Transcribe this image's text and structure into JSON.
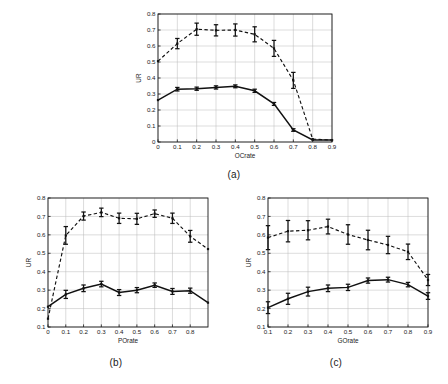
{
  "figure": {
    "background": "#ffffff",
    "foreground": "#1a1a1a",
    "grid_color": "#b9b9b9"
  },
  "panels": [
    {
      "id": "a",
      "caption": "(a)",
      "xlabel": "OCrate",
      "ylabel": "UR"
    },
    {
      "id": "b",
      "caption": "(b)",
      "xlabel": "POrate",
      "ylabel": "UR"
    },
    {
      "id": "c",
      "caption": "(c)",
      "xlabel": "GOrate",
      "ylabel": "UR"
    }
  ],
  "chart_data": [
    {
      "type": "line",
      "panel": "a",
      "title": "",
      "xlabel": "OCrate",
      "ylabel": "UR",
      "xlim": [
        0,
        0.9
      ],
      "ylim": [
        0,
        0.8
      ],
      "xticks": [
        0,
        0.1,
        0.2,
        0.3,
        0.4,
        0.5,
        0.6,
        0.7,
        0.8,
        0.9
      ],
      "xticklabels": [
        "0",
        "0.1",
        "0.2",
        "0.3",
        "0.4",
        "0.5",
        "0.6",
        "0.7",
        "0.8",
        "0.9"
      ],
      "yticks": [
        0,
        0.1,
        0.2,
        0.3,
        0.4,
        0.5,
        0.6,
        0.7,
        0.8
      ],
      "yticklabels": [
        "0",
        "0.1",
        "0.2",
        "0.3",
        "0.4",
        "0.5",
        "0.6",
        "0.7",
        "0.8"
      ],
      "grid": true,
      "legend": "none",
      "x": [
        0,
        0.1,
        0.2,
        0.3,
        0.4,
        0.5,
        0.6,
        0.7,
        0.8,
        0.9
      ],
      "series": [
        {
          "name": "upper-dashed",
          "style": "dashed",
          "values": [
            0.505,
            0.615,
            0.705,
            0.698,
            0.7,
            0.673,
            0.585,
            0.385,
            0.018,
            0.012
          ],
          "errors": [
            0.0,
            0.032,
            0.038,
            0.035,
            0.038,
            0.047,
            0.05,
            0.05,
            0.0,
            0.0
          ]
        },
        {
          "name": "lower-solid",
          "style": "solid",
          "values": [
            0.262,
            0.33,
            0.333,
            0.341,
            0.348,
            0.32,
            0.238,
            0.075,
            0.013,
            0.012
          ],
          "errors": [
            0.0,
            0.011,
            0.01,
            0.01,
            0.009,
            0.01,
            0.009,
            0.008,
            0.0,
            0.0
          ]
        }
      ]
    },
    {
      "type": "line",
      "panel": "b",
      "title": "",
      "xlabel": "POrate",
      "ylabel": "UR",
      "xlim": [
        0,
        0.9
      ],
      "ylim": [
        0.1,
        0.8
      ],
      "xticks": [
        0,
        0.1,
        0.2,
        0.3,
        0.4,
        0.5,
        0.6,
        0.7,
        0.8
      ],
      "xticklabels": [
        "0",
        "0.1",
        "0.2",
        "0.3",
        "0.4",
        "0.5",
        "0.6",
        "0.7",
        "0.8"
      ],
      "yticks": [
        0.1,
        0.2,
        0.3,
        0.4,
        0.5,
        0.6,
        0.7,
        0.8
      ],
      "yticklabels": [
        "0.1",
        "0.2",
        "0.3",
        "0.4",
        "0.5",
        "0.6",
        "0.7",
        "0.8"
      ],
      "grid": true,
      "legend": "none",
      "x": [
        0,
        0.1,
        0.2,
        0.3,
        0.4,
        0.5,
        0.6,
        0.7,
        0.8,
        0.9
      ],
      "series": [
        {
          "name": "upper-dashed",
          "style": "dashed",
          "values": [
            0.145,
            0.597,
            0.702,
            0.722,
            0.69,
            0.687,
            0.715,
            0.69,
            0.592,
            0.523
          ],
          "errors": [
            0.0,
            0.048,
            0.022,
            0.023,
            0.028,
            0.03,
            0.02,
            0.028,
            0.032,
            0.0
          ]
        },
        {
          "name": "lower-solid",
          "style": "solid",
          "values": [
            0.21,
            0.277,
            0.31,
            0.333,
            0.287,
            0.3,
            0.327,
            0.293,
            0.297,
            0.232
          ],
          "errors": [
            0.0,
            0.022,
            0.018,
            0.015,
            0.016,
            0.014,
            0.012,
            0.016,
            0.014,
            0.0
          ]
        }
      ]
    },
    {
      "type": "line",
      "panel": "c",
      "title": "",
      "xlabel": "GOrate",
      "ylabel": "UR",
      "xlim": [
        0.1,
        0.9
      ],
      "ylim": [
        0.1,
        0.8
      ],
      "xticks": [
        0.1,
        0.2,
        0.3,
        0.4,
        0.5,
        0.6,
        0.7,
        0.8,
        0.9
      ],
      "xticklabels": [
        "0.1",
        "0.2",
        "0.3",
        "0.4",
        "0.5",
        "0.6",
        "0.7",
        "0.8",
        "0.9"
      ],
      "yticks": [
        0.1,
        0.2,
        0.3,
        0.4,
        0.5,
        0.6,
        0.7,
        0.8
      ],
      "yticklabels": [
        "0.1",
        "0.2",
        "0.3",
        "0.4",
        "0.5",
        "0.6",
        "0.7",
        "0.8"
      ],
      "grid": true,
      "legend": "none",
      "x": [
        0.1,
        0.2,
        0.3,
        0.4,
        0.5,
        0.6,
        0.7,
        0.8,
        0.9
      ],
      "series": [
        {
          "name": "upper-dashed",
          "style": "dashed",
          "values": [
            0.585,
            0.62,
            0.625,
            0.645,
            0.602,
            0.572,
            0.545,
            0.508,
            0.355
          ],
          "errors": [
            0.065,
            0.058,
            0.052,
            0.04,
            0.053,
            0.053,
            0.047,
            0.042,
            0.03
          ]
        },
        {
          "name": "lower-solid",
          "style": "solid",
          "values": [
            0.205,
            0.253,
            0.292,
            0.31,
            0.315,
            0.352,
            0.357,
            0.33,
            0.268
          ],
          "errors": [
            0.032,
            0.03,
            0.024,
            0.018,
            0.017,
            0.014,
            0.013,
            0.012,
            0.018
          ]
        }
      ]
    }
  ]
}
